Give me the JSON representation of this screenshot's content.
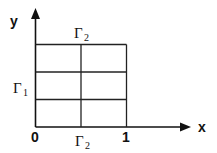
{
  "diagram": {
    "type": "domain-grid",
    "axes": {
      "x_label": "x",
      "y_label": "y",
      "origin_label": "0",
      "x_tick_label": "1"
    },
    "boundaries": {
      "top": {
        "symbol": "Γ",
        "subscript": "2"
      },
      "left": {
        "symbol": "Γ",
        "subscript": "1"
      },
      "bottom": {
        "symbol": "Γ",
        "subscript": "2"
      }
    },
    "grid": {
      "columns": 2,
      "rows": 3
    },
    "colors": {
      "line": "#111111",
      "background": "#ffffff"
    }
  }
}
